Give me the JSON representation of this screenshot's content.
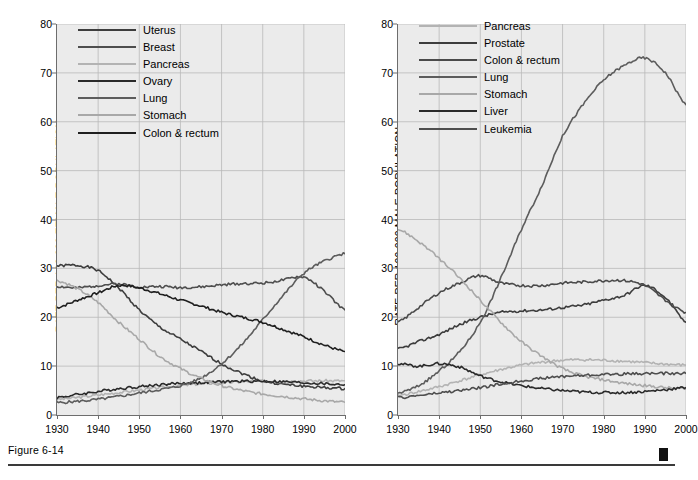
{
  "figure": {
    "caption": "Figure 6-14",
    "marker": "black-square"
  },
  "colors": {
    "plot_bg": "#ebebeb",
    "grid": "#b9b9b9",
    "axis": "#6d6d6d",
    "text": "#000000",
    "uterus": "#3d3d3d",
    "breast": "#4e4e4e",
    "pancreas": "#b3b3b3",
    "ovary": "#2a2a2a",
    "lung": "#5c5c5c",
    "stomach": "#a8a8a8",
    "colon_rectum": "#1f1f1f",
    "prostate": "#3d3d3d",
    "liver": "#2a2a2a",
    "leukemia": "#4e4e4e"
  },
  "chart_data": [
    {
      "id": "female",
      "type": "line",
      "title": "",
      "xlabel": "",
      "ylabel": "RATE PER 100,000 FEMALE POPULATION",
      "xlim": [
        1930,
        2000
      ],
      "ylim": [
        0,
        80
      ],
      "xticks": [
        1930,
        1940,
        1950,
        1960,
        1970,
        1980,
        1990,
        2000
      ],
      "yticks": [
        0,
        10,
        20,
        30,
        40,
        50,
        60,
        70,
        80
      ],
      "grid": true,
      "legend_position": "top-left",
      "x": [
        1930,
        1935,
        1940,
        1945,
        1950,
        1955,
        1960,
        1965,
        1970,
        1975,
        1980,
        1985,
        1990,
        1995,
        2000
      ],
      "series": [
        {
          "name": "Uterus",
          "color": "#3d3d3d",
          "values": [
            30.5,
            30.6,
            29.5,
            26.0,
            21.5,
            18.0,
            15.5,
            13.0,
            10.5,
            8.5,
            7.0,
            6.3,
            5.9,
            5.6,
            5.4
          ]
        },
        {
          "name": "Breast",
          "color": "#4e4e4e",
          "values": [
            26.3,
            26.0,
            26.5,
            26.8,
            26.2,
            26.3,
            26.1,
            26.2,
            26.6,
            26.9,
            27.0,
            27.6,
            28.2,
            25.3,
            21.5
          ]
        },
        {
          "name": "Pancreas",
          "color": "#b3b3b3",
          "values": [
            3.2,
            3.6,
            4.1,
            4.6,
            5.1,
            5.6,
            6.0,
            6.4,
            6.6,
            6.8,
            6.9,
            6.9,
            7.0,
            7.0,
            7.0
          ]
        },
        {
          "name": "Ovary",
          "color": "#2a2a2a",
          "values": [
            3.6,
            4.2,
            4.8,
            5.4,
            5.8,
            6.2,
            6.5,
            6.6,
            6.8,
            6.9,
            6.9,
            6.8,
            6.6,
            6.4,
            6.2
          ]
        },
        {
          "name": "Lung",
          "color": "#5c5c5c",
          "values": [
            2.5,
            2.8,
            3.2,
            3.8,
            4.5,
            5.2,
            6.0,
            7.6,
            10.5,
            14.5,
            19.5,
            24.5,
            29.0,
            31.5,
            33.0
          ]
        },
        {
          "name": "Stomach",
          "color": "#a8a8a8",
          "values": [
            27.5,
            25.8,
            23.0,
            19.0,
            15.5,
            12.0,
            9.5,
            7.5,
            6.0,
            5.0,
            4.3,
            3.8,
            3.3,
            2.9,
            2.6
          ]
        },
        {
          "name": "Colon & rectum",
          "color": "#1f1f1f",
          "values": [
            22.0,
            23.5,
            25.0,
            26.5,
            26.0,
            24.8,
            23.5,
            22.3,
            21.0,
            20.0,
            19.0,
            17.5,
            16.0,
            14.3,
            13.0
          ]
        }
      ]
    },
    {
      "id": "male",
      "type": "line",
      "title": "",
      "xlabel": "",
      "ylabel": "RATE PER 100,000 MALE POPULATION",
      "xlim": [
        1930,
        2000
      ],
      "ylim": [
        0,
        80
      ],
      "xticks": [
        1930,
        1940,
        1950,
        1960,
        1970,
        1980,
        1990,
        2000
      ],
      "yticks": [
        0,
        10,
        20,
        30,
        40,
        50,
        60,
        70,
        80
      ],
      "grid": true,
      "legend_position": "top-left",
      "x": [
        1930,
        1935,
        1940,
        1945,
        1950,
        1955,
        1960,
        1965,
        1970,
        1975,
        1980,
        1985,
        1990,
        1995,
        2000
      ],
      "series": [
        {
          "name": "Pancreas",
          "color": "#b3b3b3",
          "values": [
            4.0,
            4.8,
            5.8,
            7.0,
            8.2,
            9.3,
            10.2,
            10.8,
            11.2,
            11.3,
            11.2,
            11.0,
            10.7,
            10.4,
            10.2
          ]
        },
        {
          "name": "Prostate",
          "color": "#3d3d3d",
          "values": [
            13.5,
            15.0,
            16.5,
            18.5,
            20.0,
            21.0,
            21.3,
            21.5,
            22.0,
            22.5,
            23.5,
            24.5,
            26.5,
            24.0,
            19.0
          ]
        },
        {
          "name": "Colon & rectum",
          "color": "#4a4a4a",
          "values": [
            19.0,
            22.0,
            25.0,
            27.0,
            28.5,
            27.0,
            26.5,
            26.5,
            27.0,
            27.2,
            27.5,
            27.5,
            26.5,
            23.5,
            21.0
          ]
        },
        {
          "name": "Lung",
          "color": "#5c5c5c",
          "values": [
            4.5,
            6.0,
            9.0,
            13.0,
            19.0,
            28.0,
            38.0,
            47.0,
            57.0,
            63.5,
            68.5,
            71.5,
            73.0,
            70.0,
            63.5
          ]
        },
        {
          "name": "Stomach",
          "color": "#a8a8a8",
          "values": [
            38.0,
            35.5,
            32.0,
            28.0,
            23.5,
            19.0,
            15.0,
            12.0,
            9.5,
            8.0,
            7.2,
            6.5,
            6.0,
            5.6,
            5.3
          ]
        },
        {
          "name": "Liver",
          "color": "#2a2a2a",
          "values": [
            10.5,
            10.0,
            10.5,
            9.8,
            8.0,
            6.8,
            6.0,
            5.4,
            5.0,
            4.7,
            4.6,
            4.6,
            4.8,
            5.2,
            5.6
          ]
        },
        {
          "name": "Leukemia",
          "color": "#4e4e4e",
          "values": [
            3.5,
            4.0,
            4.5,
            5.0,
            5.6,
            6.3,
            7.0,
            7.5,
            7.9,
            8.1,
            8.3,
            8.4,
            8.5,
            8.5,
            8.5
          ]
        }
      ]
    }
  ]
}
